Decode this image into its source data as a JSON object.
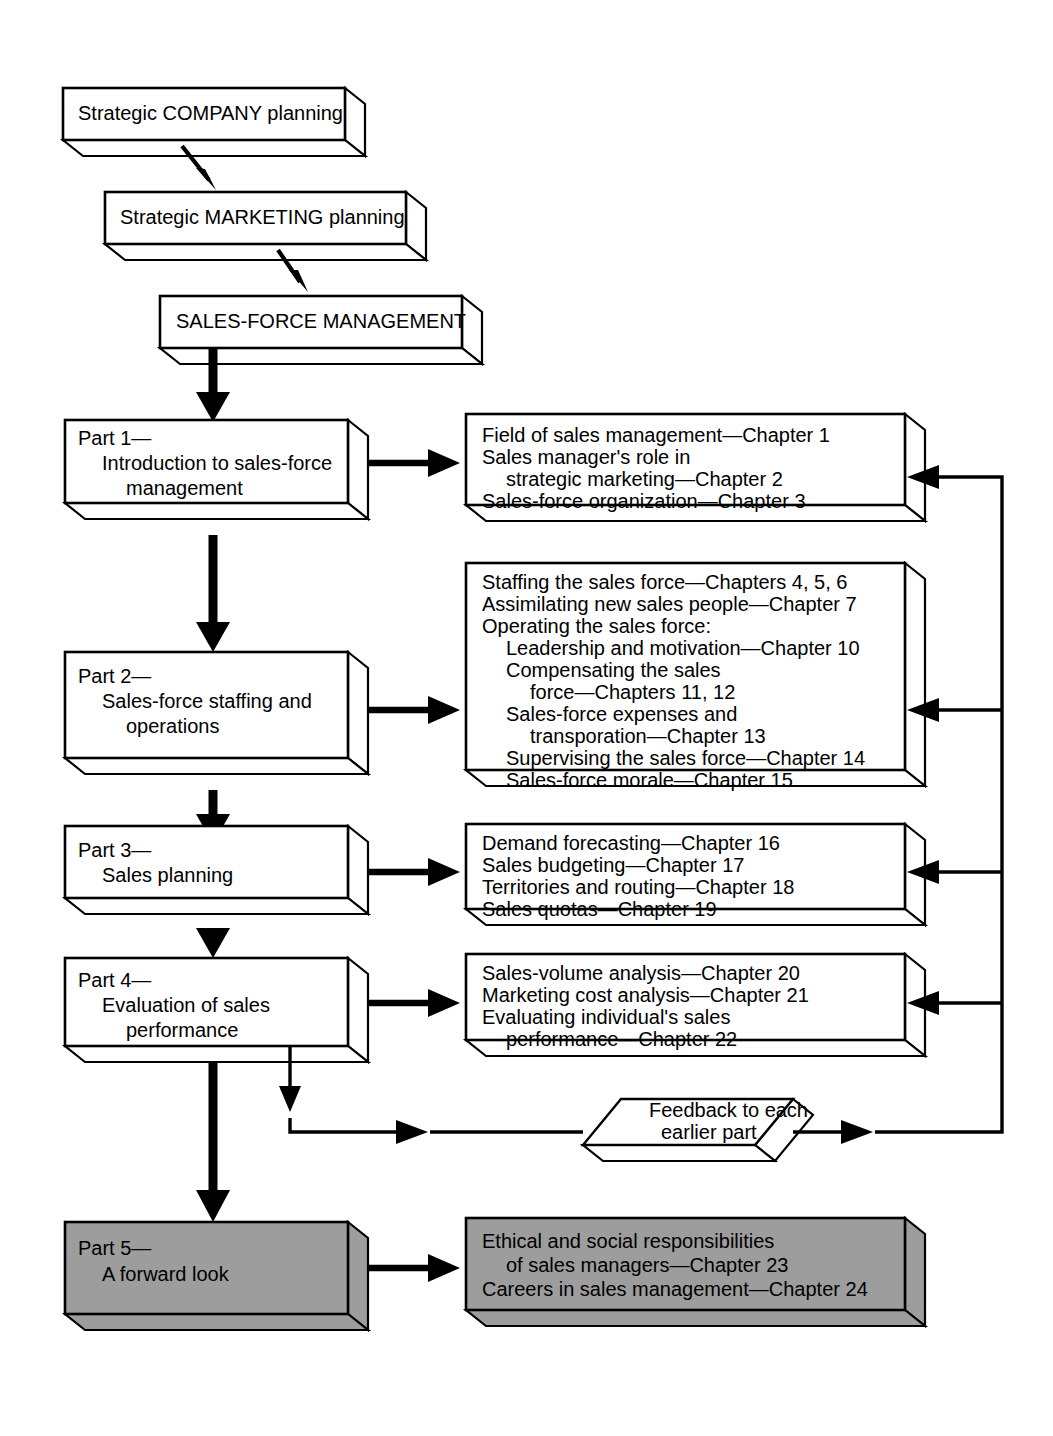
{
  "figure": {
    "background_color": "#ffffff",
    "line_color": "#000000",
    "shaded_fill": "#9d9d9d"
  },
  "top_chain": [
    {
      "id": "strategic-company",
      "text": "Strategic COMPANY planning"
    },
    {
      "id": "strategic-marketing",
      "text": "Strategic MARKETING planning"
    },
    {
      "id": "sales-force-management",
      "text": "SALES-FORCE MANAGEMENT"
    }
  ],
  "parts": [
    {
      "id": "part-1",
      "lines": [
        "Part 1—",
        "Introduction to sales-force",
        "management"
      ],
      "indents": [
        0,
        1,
        2
      ],
      "shaded": false
    },
    {
      "id": "part-2",
      "lines": [
        "Part 2—",
        "Sales-force staffing and",
        "operations"
      ],
      "indents": [
        0,
        1,
        2
      ],
      "shaded": false
    },
    {
      "id": "part-3",
      "lines": [
        "Part 3—",
        "Sales planning"
      ],
      "indents": [
        0,
        1
      ],
      "shaded": false
    },
    {
      "id": "part-4",
      "lines": [
        "Part 4—",
        "Evaluation of sales",
        "performance"
      ],
      "indents": [
        0,
        1,
        2
      ],
      "shaded": false
    },
    {
      "id": "part-5",
      "lines": [
        "Part 5—",
        "A forward look"
      ],
      "indents": [
        0,
        1
      ],
      "shaded": true
    }
  ],
  "chapter_boxes": [
    {
      "id": "chapters-part-1",
      "shaded": false,
      "lines": [
        "Field of sales management—Chapter 1",
        "Sales manager's role in",
        "strategic marketing—Chapter 2",
        "Sales-force organization—Chapter 3"
      ],
      "indents": [
        0,
        0,
        1,
        0
      ]
    },
    {
      "id": "chapters-part-2",
      "shaded": false,
      "lines": [
        "Staffing the sales force—Chapters 4, 5, 6",
        "Assimilating new sales people—Chapter 7",
        "Operating the sales force:",
        "Leadership and motivation—Chapter 10",
        "Compensating the sales",
        "force—Chapters 11, 12",
        "Sales-force expenses and",
        "transporation—Chapter 13",
        "Supervising the sales force—Chapter 14",
        "Sales-force morale—Chapter 15"
      ],
      "indents": [
        0,
        0,
        0,
        1,
        1,
        2,
        1,
        2,
        1,
        1
      ]
    },
    {
      "id": "chapters-part-3",
      "shaded": false,
      "lines": [
        "Demand forecasting—Chapter 16",
        "Sales budgeting—Chapter 17",
        "Territories and routing—Chapter 18",
        "Sales quotas—Chapter 19"
      ],
      "indents": [
        0,
        0,
        0,
        0
      ]
    },
    {
      "id": "chapters-part-4",
      "shaded": false,
      "lines": [
        "Sales-volume analysis—Chapter 20",
        "Marketing cost analysis—Chapter 21",
        "Evaluating individual's sales",
        "performance—Chapter 22"
      ],
      "indents": [
        0,
        0,
        0,
        1
      ]
    },
    {
      "id": "chapters-part-5",
      "shaded": true,
      "lines": [
        "Ethical and social responsibilities",
        "of sales managers—Chapter 23",
        "Careers in sales management—Chapter 24"
      ],
      "indents": [
        0,
        1,
        0
      ]
    }
  ],
  "feedback": {
    "id": "feedback-node",
    "lines": [
      "Feedback to each",
      "earlier part"
    ]
  }
}
